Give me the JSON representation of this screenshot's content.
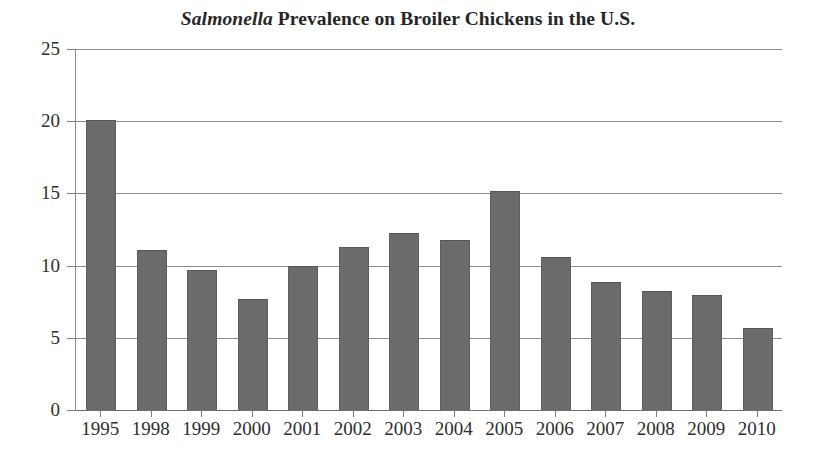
{
  "chart_data": {
    "type": "bar",
    "title": "Salmonella Prevalence on Broiler Chickens in the U.S.",
    "title_emphasis": "Salmonella",
    "title_rest": " Prevalence on Broiler Chickens in the U.S.",
    "xlabel": "",
    "ylabel": "",
    "categories": [
      "1995",
      "1998",
      "1999",
      "2000",
      "2001",
      "2002",
      "2003",
      "2004",
      "2005",
      "2006",
      "2007",
      "2008",
      "2009",
      "2010"
    ],
    "values": [
      20.0,
      11.0,
      9.6,
      7.6,
      9.9,
      11.2,
      12.2,
      11.7,
      15.1,
      10.5,
      8.8,
      8.2,
      7.9,
      5.6
    ],
    "series": [
      {
        "name": "Salmonella prevalence (percent)",
        "values": [
          20.0,
          11.0,
          9.6,
          7.6,
          9.9,
          11.2,
          12.2,
          11.7,
          15.1,
          10.5,
          8.8,
          8.2,
          7.9,
          5.6
        ]
      }
    ],
    "ylim": [
      0,
      25
    ],
    "ytick_labels": [
      "0",
      "5",
      "10",
      "15",
      "20",
      "25"
    ],
    "ytick_values": [
      0,
      5,
      10,
      15,
      20,
      25
    ],
    "grid": true,
    "grid_axis": "y",
    "legend": false,
    "legend_position": "none",
    "bar_color": "#6b6b6b",
    "grid_color": "#8d8d8d",
    "text_color": "#2e2e2e",
    "background_color": "#ffffff"
  }
}
